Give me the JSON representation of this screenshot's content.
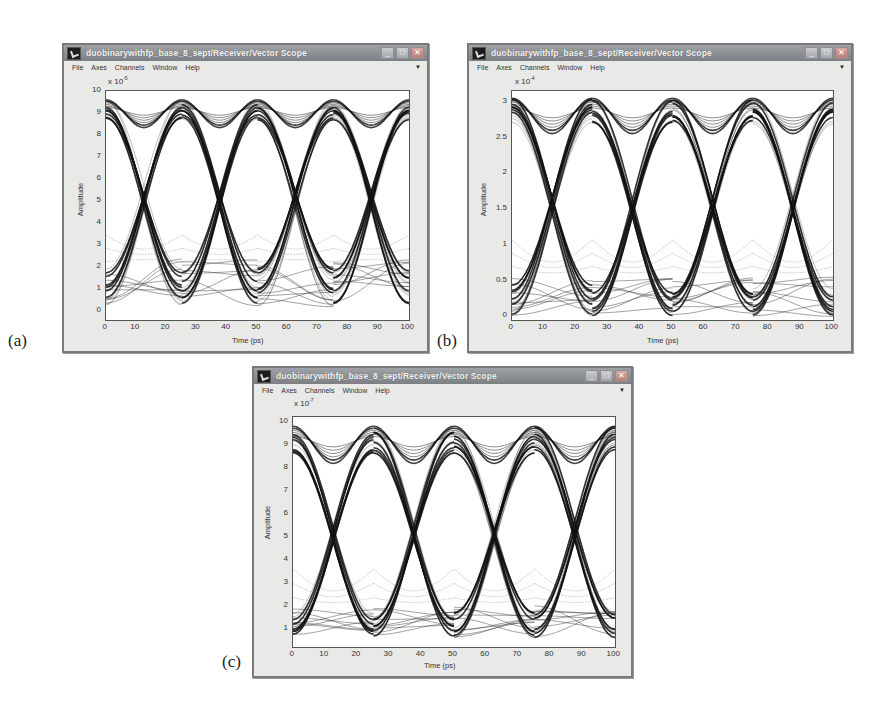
{
  "figure": {
    "panels": [
      {
        "label": "(a)",
        "window": {
          "title": "duobinarywithfp_base_8_sept/Receiver/Vector Scope",
          "menu": [
            "File",
            "Axes",
            "Channels",
            "Window",
            "Help"
          ],
          "controls": [
            "minimize",
            "maximize",
            "close"
          ]
        },
        "exponent_label": "x 10",
        "exponent_power": "-5"
      },
      {
        "label": "(b)",
        "window": {
          "title": "duobinarywithfp_base_8_sept/Receiver/Vector Scope",
          "menu": [
            "File",
            "Axes",
            "Channels",
            "Window",
            "Help"
          ],
          "controls": [
            "minimize",
            "maximize",
            "close"
          ]
        },
        "exponent_label": "x 10",
        "exponent_power": "-4"
      },
      {
        "label": "(c)",
        "window": {
          "title": "duobinarywithfp_base_8_sept/Receiver/Vector Scope",
          "menu": [
            "File",
            "Axes",
            "Channels",
            "Window",
            "Help"
          ],
          "controls": [
            "minimize",
            "maximize",
            "close"
          ]
        },
        "exponent_label": "x 10",
        "exponent_power": "-7"
      }
    ]
  },
  "chart_data": [
    {
      "type": "line",
      "title": "Eye diagram (a)",
      "xlabel": "Time (ps)",
      "ylabel": "Amplitude",
      "x_ticks": [
        0,
        10,
        20,
        30,
        40,
        50,
        60,
        70,
        80,
        90,
        100
      ],
      "y_ticks": [
        0,
        1,
        2,
        3,
        4,
        5,
        6,
        7,
        8,
        9,
        10
      ],
      "xlim": [
        0,
        100
      ],
      "ylim": [
        -0.4,
        10
      ],
      "y_scale_exponent": "x 10^-5",
      "bit_period_ps": 25,
      "eye_crossings_x": [
        12.5,
        37.5,
        62.5,
        87.5
      ],
      "crossing_level": 5.0,
      "high_level": [
        8.2,
        9.6
      ],
      "low_level": [
        0.2,
        2.4
      ],
      "grid": false
    },
    {
      "type": "line",
      "title": "Eye diagram (b)",
      "xlabel": "Time (ps)",
      "ylabel": "Amplitude",
      "x_ticks": [
        0,
        10,
        20,
        30,
        40,
        50,
        60,
        70,
        80,
        90,
        100
      ],
      "y_ticks": [
        0,
        0.5,
        1,
        1.5,
        2,
        2.5,
        3
      ],
      "xlim": [
        0,
        100
      ],
      "ylim": [
        -0.05,
        3.15
      ],
      "y_scale_exponent": "x 10^-4",
      "bit_period_ps": 25,
      "eye_crossings_x": [
        12.5,
        37.5,
        62.5,
        87.5
      ],
      "crossing_level": 1.55,
      "high_level": [
        2.5,
        3.05
      ],
      "low_level": [
        0.0,
        0.55
      ],
      "grid": false
    },
    {
      "type": "line",
      "title": "Eye diagram (c)",
      "xlabel": "Time (ps)",
      "ylabel": "Amplitude",
      "x_ticks": [
        0,
        10,
        20,
        30,
        40,
        50,
        60,
        70,
        80,
        90,
        100
      ],
      "y_ticks": [
        1,
        2,
        3,
        4,
        5,
        6,
        7,
        8,
        9,
        10
      ],
      "xlim": [
        0,
        100
      ],
      "ylim": [
        0.2,
        10.2
      ],
      "y_scale_exponent": "x 10^-7",
      "bit_period_ps": 25,
      "eye_crossings_x": [
        12.5,
        37.5,
        62.5,
        87.5
      ],
      "crossing_level": 5.2,
      "high_level": [
        8.0,
        9.8
      ],
      "low_level": [
        0.6,
        2.0
      ],
      "grid": false
    }
  ]
}
